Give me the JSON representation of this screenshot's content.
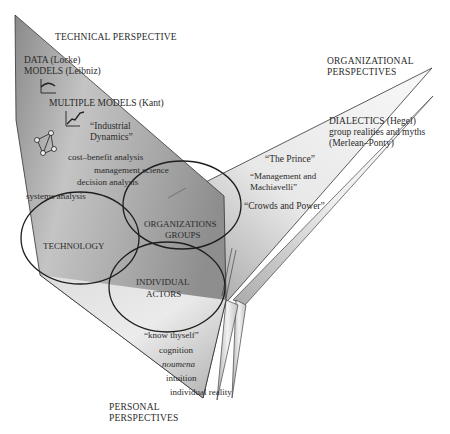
{
  "diagram": {
    "type": "three-perspective model",
    "colors": {
      "panel_dark": "#8c8c8c",
      "panel_mid": "#bdbdbd",
      "panel_light": "#f2f2f2",
      "outline": "#222222",
      "text": "#2a2a2a",
      "background": "#ffffff"
    },
    "technical": {
      "title": "TECHNICAL PERSPECTIVE",
      "items": [
        "DATA (Locke)",
        "MODELS (Leibniz)",
        "MULTIPLE MODELS (Kant)",
        "“Industrial",
        "Dynamics”",
        "cost–benefit analysis",
        "management science",
        "decision analysis",
        "systems analysis"
      ],
      "icons": [
        "curve-graph-icon",
        "rising-line-graph-icon",
        "network-graph-icon"
      ]
    },
    "organizational": {
      "title_line1": "ORGANIZATIONAL",
      "title_line2": "PERSPECTIVES",
      "items": [
        "DIALECTICS (Hegel)",
        "group realities and myths",
        "(Merlean–Ponty)",
        "“The Prince”",
        "“Management and",
        "Machiavelli”",
        "“Crowds and Power”"
      ]
    },
    "personal": {
      "title_line1": "PERSONAL",
      "title_line2": "PERSPECTIVES",
      "items": [
        "“know thyself”",
        "cognition",
        "noumena",
        "intuition",
        "individual reality"
      ]
    },
    "circles": {
      "technology": "TECHNOLOGY",
      "organizations_line1": "ORGANIZATIONS",
      "organizations_line2": "GROUPS",
      "individual_line1": "INDIVIDUAL",
      "individual_line2": "ACTORS"
    }
  }
}
